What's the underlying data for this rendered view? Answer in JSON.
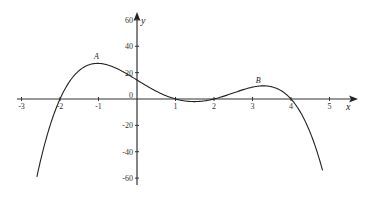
{
  "chart_data": {
    "type": "line",
    "title": "",
    "xlabel": "x",
    "ylabel": "y",
    "xlim": [
      -3,
      5.7
    ],
    "ylim": [
      -65,
      65
    ],
    "grid": false,
    "legend": null,
    "x_ticks": [
      -3,
      -2,
      -1,
      1,
      2,
      3,
      4,
      5
    ],
    "x_tick_labels": [
      "-3",
      "-2",
      "-1",
      "1",
      "2",
      "3",
      "4",
      "5"
    ],
    "y_ticks": [
      60,
      40,
      20,
      0,
      -20,
      -40,
      -60
    ],
    "y_tick_labels": [
      "60",
      "40",
      "20",
      "0",
      "-20",
      "-40",
      "-60"
    ],
    "series": [
      {
        "name": "curve",
        "x": [
          -2.6,
          -2.4,
          -2.2,
          -2.0,
          -1.8,
          -1.6,
          -1.4,
          -1.2,
          -1.0,
          -0.8,
          -0.6,
          -0.4,
          -0.2,
          0.0,
          0.2,
          0.4,
          0.6,
          0.8,
          1.0,
          1.2,
          1.4,
          1.6,
          1.8,
          2.0,
          2.2,
          2.4,
          2.6,
          2.8,
          3.0,
          3.2,
          3.4,
          3.6,
          3.8,
          4.0,
          4.2,
          4.4,
          4.6,
          4.8
        ],
        "y": [
          -59,
          -38,
          -18,
          0,
          11,
          19,
          24,
          26,
          27,
          26,
          24,
          21,
          17,
          14,
          10,
          7,
          4,
          1,
          0,
          -2,
          -2,
          -2,
          -1,
          0,
          2,
          5,
          7,
          8,
          9,
          9,
          9,
          7,
          4,
          0,
          -6,
          -14,
          -24,
          -37
        ]
      }
    ],
    "annotations": [
      {
        "text": "A",
        "x": -1.0,
        "y": 27
      },
      {
        "text": "B",
        "x": 3.2,
        "y": 9
      }
    ]
  }
}
